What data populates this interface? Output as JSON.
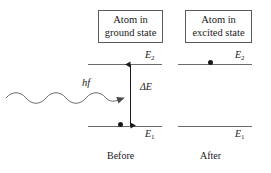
{
  "diagram": {
    "stroke_color": "#6b6b6b",
    "text_color": "#1a1a1a",
    "electron_color": "#1a1a1a"
  },
  "boxes": {
    "ground": {
      "line1": "Atom in",
      "line2": "ground state"
    },
    "excited": {
      "line1": "Atom in",
      "line2": "excited state"
    }
  },
  "levels": {
    "before": {
      "upper_label": "E",
      "upper_sub": "2",
      "lower_label": "E",
      "lower_sub": "1",
      "electron_on": "lower"
    },
    "after": {
      "upper_label": "E",
      "upper_sub": "2",
      "lower_label": "E",
      "lower_sub": "1",
      "electron_on": "upper"
    }
  },
  "transition": {
    "energy_label": "ΔE",
    "arrow_direction": "double-headed-vertical"
  },
  "photon": {
    "label": "hf",
    "direction": "rightward",
    "cycles": 3
  },
  "captions": {
    "before": "Before",
    "after": "After"
  }
}
